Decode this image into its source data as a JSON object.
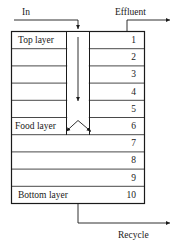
{
  "figure": {
    "stroke_color": "#1a1a1a",
    "background_color": "#ffffff"
  },
  "flows": {
    "inlet": {
      "label": "In",
      "direction": "down-into-column"
    },
    "outlet": {
      "label": "Effluent",
      "direction": "right-out"
    },
    "recycle": {
      "label": "Recycle",
      "direction": "right-out-bottom"
    }
  },
  "column": {
    "layer_labels": {
      "top": "Top layer",
      "food": "Food layer",
      "bottom": "Bottom layer"
    },
    "rows": [
      {
        "number": "1",
        "label": "Top layer"
      },
      {
        "number": "2",
        "label": ""
      },
      {
        "number": "3",
        "label": ""
      },
      {
        "number": "4",
        "label": ""
      },
      {
        "number": "5",
        "label": ""
      },
      {
        "number": "6",
        "label": "Food layer"
      },
      {
        "number": "7",
        "label": ""
      },
      {
        "number": "8",
        "label": ""
      },
      {
        "number": "9",
        "label": ""
      },
      {
        "number": "10",
        "label": "Bottom layer"
      }
    ]
  },
  "icons": {
    "downflow_arrow": "down-arrow-icon",
    "spread_left_arrow": "diverging-left-arrow-icon",
    "spread_right_arrow": "diverging-right-arrow-icon"
  }
}
